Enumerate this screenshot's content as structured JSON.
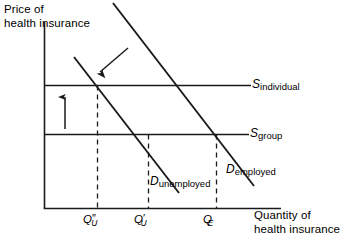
{
  "figure": {
    "type": "economics-supply-demand-diagram",
    "background_color": "#ffffff",
    "line_color": "#1a1a1a"
  },
  "axes": {
    "y_title_line1": "Price of",
    "y_title_line2": "health insurance",
    "x_title_line1": "Quantity of",
    "x_title_line2": "health insurance"
  },
  "supply_curves": [
    {
      "id": "s-individual",
      "base": "S",
      "subscript": "individual",
      "kind": "horizontal",
      "y": 85
    },
    {
      "id": "s-group",
      "base": "S",
      "subscript": "group",
      "kind": "horizontal",
      "y": 134
    }
  ],
  "demand_curves": [
    {
      "id": "d-employed",
      "base": "D",
      "subscript": "employed",
      "kind": "downward-sloping"
    },
    {
      "id": "d-unemployed",
      "base": "D",
      "subscript": "unemployed",
      "kind": "downward-sloping"
    }
  ],
  "ticks": [
    {
      "id": "qu-double-prime",
      "base": "Q",
      "prime": "″",
      "subscript": "U",
      "x": 97
    },
    {
      "id": "qu-prime",
      "base": "Q",
      "prime": "′",
      "subscript": "U",
      "x": 148
    },
    {
      "id": "qe",
      "base": "Q",
      "prime": "",
      "subscript": "E",
      "x": 216
    }
  ],
  "annotations": [
    {
      "id": "price-increase-arrow",
      "name": "up-arrow",
      "direction": "up"
    },
    {
      "id": "demand-shift-arrow",
      "name": "diagonal-arrow",
      "direction": "down-left"
    }
  ]
}
